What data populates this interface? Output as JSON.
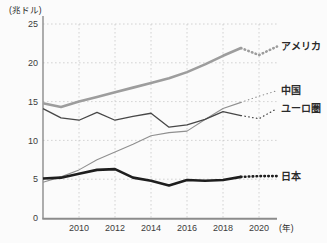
{
  "chart_data": {
    "type": "line",
    "ylabel": "(兆ドル)",
    "xlabel": "(年)",
    "x": [
      2008,
      2009,
      2010,
      2011,
      2012,
      2013,
      2014,
      2015,
      2016,
      2017,
      2018,
      2019,
      2020,
      2021
    ],
    "x_ticks": [
      2010,
      2012,
      2014,
      2016,
      2018,
      2020
    ],
    "y_ticks": [
      0,
      5,
      10,
      15,
      20,
      25
    ],
    "xlim": [
      2008,
      2021
    ],
    "ylim": [
      0,
      25
    ],
    "grid": true,
    "legend_position": "right-of-line-ends",
    "solid_points": 12,
    "dotted_after_year": 2019,
    "series": [
      {
        "key": "usa",
        "name": "アメリカ",
        "color": "#9d9d9d",
        "width": 2.6,
        "values": [
          14.8,
          14.3,
          15.0,
          15.6,
          16.2,
          16.8,
          17.4,
          18.0,
          18.8,
          19.8,
          20.9,
          21.9,
          21.0,
          22.1
        ]
      },
      {
        "key": "china",
        "name": "中国",
        "color": "#8f8f8f",
        "width": 1.1,
        "values": [
          4.6,
          5.3,
          6.2,
          7.5,
          8.5,
          9.5,
          10.6,
          11.0,
          11.2,
          12.7,
          14.1,
          14.9,
          15.7,
          16.4
        ]
      },
      {
        "key": "eurozone",
        "name": "ユーロ圏",
        "color": "#474747",
        "width": 1.3,
        "values": [
          14.1,
          12.9,
          12.6,
          13.6,
          12.6,
          13.1,
          13.5,
          11.7,
          12.0,
          12.7,
          13.7,
          13.2,
          12.8,
          14.1
        ]
      },
      {
        "key": "japan",
        "name": "日本",
        "color": "#1e1e1e",
        "width": 2.6,
        "values": [
          5.1,
          5.2,
          5.7,
          6.2,
          6.3,
          5.2,
          4.8,
          4.2,
          4.9,
          4.8,
          4.9,
          5.3,
          5.4,
          5.4
        ]
      }
    ],
    "colors": {
      "gridline": "#c9c9c9",
      "axis": "#8b8b8b",
      "text": "#2a2a2a",
      "background": "#fbfbfb"
    }
  }
}
